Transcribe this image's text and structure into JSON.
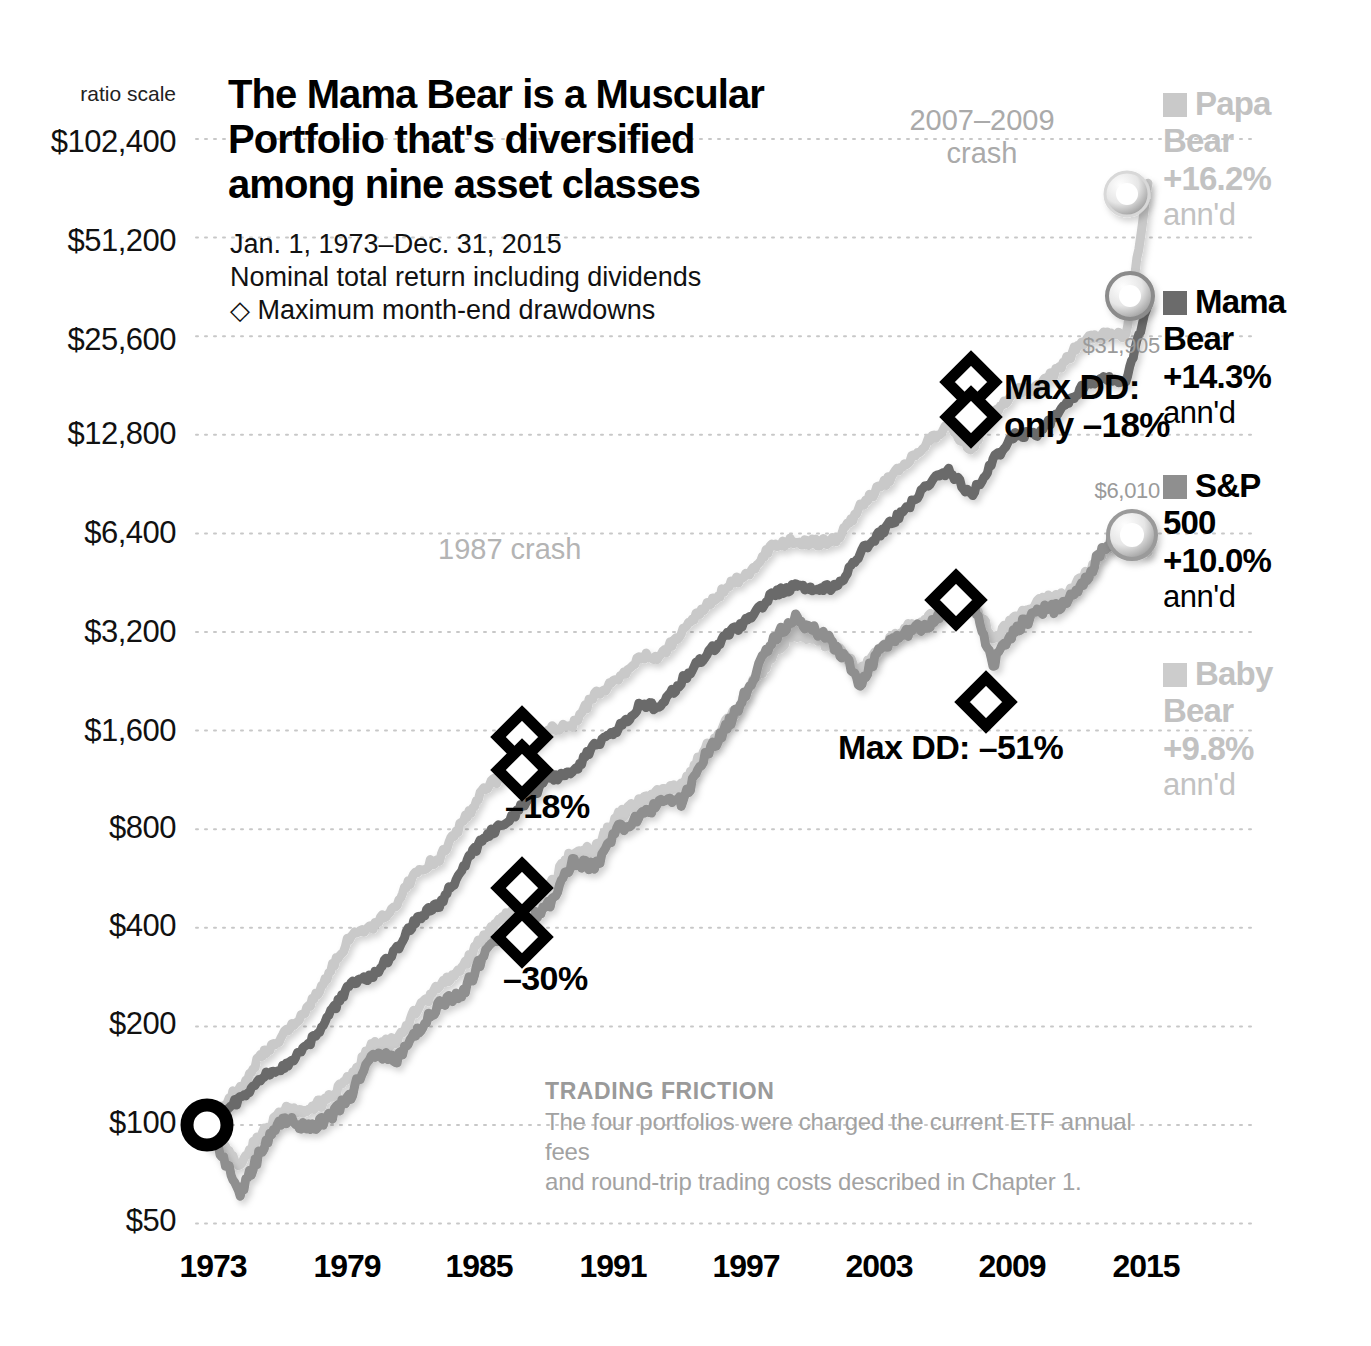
{
  "title": "The Mama Bear is a Muscular Portfolio that's diversified among nine asset classes",
  "subtitle": {
    "period": "Jan. 1, 1973–Dec. 31, 2015",
    "basis": "Nominal total return including dividends",
    "drawdown_key": "Maximum month-end drawdowns",
    "drawdown_marker": "◇"
  },
  "axis": {
    "ratio_scale_label": "ratio scale",
    "y_ticks": [
      "$102,400",
      "$51,200",
      "$25,600",
      "$12,800",
      "$6,400",
      "$3,200",
      "$1,600",
      "$800",
      "$400",
      "$200",
      "$100",
      "$50"
    ],
    "x_ticks": [
      "1973",
      "1979",
      "1985",
      "1991",
      "1997",
      "2003",
      "2009",
      "2015"
    ]
  },
  "annotations": {
    "crash_2007": "2007–2009\ncrash",
    "crash_2007_line1": "2007–2009",
    "crash_2007_line2": "crash",
    "crash_1987": "1987 crash",
    "mama_dd_line1": "Max DD:",
    "mama_dd_line2": "only –18%",
    "sp500_dd": "Max DD: –51%",
    "papa_dd": "–18%",
    "baby_dd": "–30%",
    "mama_end_value": "$31,905",
    "sp500_end_value": "$6,010"
  },
  "legend": [
    {
      "name_line1": "Papa",
      "name_line2": "Bear",
      "return": "+16.2%",
      "suffix": "ann'd",
      "color": "#c9c9c9",
      "text_color": "#c2c2c2"
    },
    {
      "name_line1": "Mama",
      "name_line2": "Bear",
      "return": "+14.3%",
      "suffix": "ann'd",
      "color": "#6b6b6b",
      "text_color": "#000000"
    },
    {
      "name_line1": "S&P",
      "name_line2": "500",
      "return": "+10.0%",
      "suffix": "ann'd",
      "color": "#8f8f8f",
      "text_color": "#000000"
    },
    {
      "name_line1": "Baby",
      "name_line2": "Bear",
      "return": "+9.8%",
      "suffix": "ann'd",
      "color": "#cccccc",
      "text_color": "#c2c2c2"
    }
  ],
  "friction": {
    "heading": "TRADING FRICTION",
    "line1": "The four portfolios were charged the current ETF annual fees",
    "line2": "and round-trip trading costs described in Chapter 1."
  },
  "chart_data": {
    "type": "line",
    "title": "The Mama Bear is a Muscular Portfolio that's diversified among nine asset classes",
    "subtitle": "Jan. 1, 1973–Dec. 31, 2015 — Nominal total return including dividends",
    "xlabel": "",
    "ylabel": "Growth of $100 (ratio scale)",
    "scale": "log",
    "ylim": [
      50,
      102400
    ],
    "xlim": [
      1973,
      2016
    ],
    "ytick_values": [
      102400,
      51200,
      25600,
      12800,
      6400,
      3200,
      1600,
      800,
      400,
      200,
      100,
      50
    ],
    "xtick_values": [
      1973,
      1979,
      1985,
      1991,
      1997,
      2003,
      2009,
      2015
    ],
    "grid": "dotted-horizontal",
    "legend_position": "right",
    "series": [
      {
        "name": "Papa Bear",
        "color": "#c9c9c9",
        "annualized_return_pct": 16.2,
        "start_value": 100,
        "end_value": 75000,
        "max_drawdown_pct": -18,
        "x": [
          1973,
          1974,
          1975,
          1976,
          1977,
          1978,
          1979,
          1980,
          1981,
          1982,
          1983,
          1984,
          1985,
          1986,
          1987,
          1988,
          1989,
          1990,
          1991,
          1992,
          1993,
          1994,
          1995,
          1996,
          1997,
          1998,
          1999,
          2000,
          2001,
          2002,
          2003,
          2004,
          2005,
          2006,
          2007,
          2008,
          2009,
          2010,
          2011,
          2012,
          2013,
          2014,
          2015,
          2016
        ],
        "values": [
          100,
          112,
          130,
          165,
          190,
          225,
          290,
          380,
          400,
          470,
          600,
          650,
          830,
          1060,
          1180,
          1400,
          1620,
          1650,
          2050,
          2250,
          2700,
          2700,
          3250,
          3800,
          4400,
          4900,
          5800,
          6100,
          6000,
          6100,
          7800,
          9000,
          10300,
          12200,
          13800,
          11500,
          14800,
          17500,
          17800,
          20500,
          24500,
          26000,
          25500,
          75000
        ]
      },
      {
        "name": "Mama Bear",
        "color": "#6b6b6b",
        "annualized_return_pct": 14.3,
        "start_value": 100,
        "end_value": 31905,
        "max_drawdown_pct": -18,
        "x": [
          1973,
          1974,
          1975,
          1976,
          1977,
          1978,
          1979,
          1980,
          1981,
          1982,
          1983,
          1984,
          1985,
          1986,
          1987,
          1988,
          1989,
          1990,
          1991,
          1992,
          1993,
          1994,
          1995,
          1996,
          1997,
          1998,
          1999,
          2000,
          2001,
          2002,
          2003,
          2004,
          2005,
          2006,
          2007,
          2008,
          2009,
          2010,
          2011,
          2012,
          2013,
          2014,
          2015,
          2016
        ],
        "values": [
          100,
          108,
          120,
          140,
          152,
          172,
          215,
          270,
          285,
          340,
          430,
          470,
          600,
          760,
          830,
          990,
          1150,
          1180,
          1450,
          1600,
          1900,
          1900,
          2300,
          2700,
          3150,
          3500,
          4150,
          4400,
          4350,
          4400,
          5600,
          6500,
          7500,
          8900,
          10000,
          8300,
          10700,
          12700,
          12900,
          14900,
          17800,
          19000,
          18600,
          31905
        ]
      },
      {
        "name": "S&P 500",
        "color": "#8f8f8f",
        "annualized_return_pct": 10.0,
        "start_value": 100,
        "end_value": 6010,
        "max_drawdown_pct": -51,
        "x": [
          1973,
          1974,
          1975,
          1976,
          1977,
          1978,
          1979,
          1980,
          1981,
          1982,
          1983,
          1984,
          1985,
          1986,
          1987,
          1988,
          1989,
          1990,
          1991,
          1992,
          1993,
          1994,
          1995,
          1996,
          1997,
          1998,
          1999,
          2000,
          2001,
          2002,
          2003,
          2004,
          2005,
          2006,
          2007,
          2008,
          2009,
          2010,
          2011,
          2012,
          2013,
          2014,
          2015,
          2016
        ],
        "values": [
          100,
          85,
          62,
          85,
          105,
          98,
          105,
          124,
          165,
          157,
          191,
          234,
          249,
          329,
          389,
          410,
          478,
          630,
          610,
          795,
          875,
          965,
          975,
          1340,
          1650,
          2200,
          2950,
          3570,
          3240,
          2855,
          2225,
          2865,
          3175,
          3330,
          3855,
          4070,
          2560,
          3235,
          3720,
          3800,
          4410,
          5840,
          6640,
          6010
        ]
      },
      {
        "name": "Baby Bear",
        "color": "#cccccc",
        "annualized_return_pct": 9.8,
        "start_value": 100,
        "end_value": 5600,
        "max_drawdown_pct": -30,
        "x": [
          1973,
          1974,
          1975,
          1976,
          1977,
          1978,
          1979,
          1980,
          1981,
          1982,
          1983,
          1984,
          1985,
          1986,
          1987,
          1988,
          1989,
          1990,
          1991,
          1992,
          1993,
          1994,
          1995,
          1996,
          1997,
          1998,
          1999,
          2000,
          2001,
          2002,
          2003,
          2004,
          2005,
          2006,
          2007,
          2008,
          2009,
          2010,
          2011,
          2012,
          2013,
          2014,
          2015,
          2016
        ],
        "values": [
          100,
          90,
          75,
          95,
          112,
          110,
          120,
          140,
          175,
          180,
          225,
          270,
          300,
          380,
          440,
          470,
          540,
          680,
          690,
          870,
          960,
          1050,
          1080,
          1400,
          1700,
          2150,
          2700,
          3200,
          3050,
          2850,
          2400,
          2950,
          3250,
          3450,
          3900,
          4100,
          3000,
          3500,
          3950,
          4050,
          4600,
          5700,
          6200,
          5600
        ]
      }
    ],
    "drawdown_markers": [
      {
        "series": "Papa Bear",
        "label": "–18%",
        "top_value": 1550,
        "bottom_value": 1150,
        "year": 1987
      },
      {
        "series": "Baby Bear",
        "label": "–30%",
        "top_value": 520,
        "bottom_value": 370,
        "year": 1987
      },
      {
        "series": "Mama Bear",
        "label": "Max DD: only –18%",
        "top_value": 19500,
        "bottom_value": 14000,
        "year": 2008
      },
      {
        "series": "S&P 500",
        "label": "Max DD: –51%",
        "top_value": 3950,
        "bottom_value": 1950,
        "year": 2008
      }
    ],
    "endpoint_markers": [
      {
        "series": "Papa Bear",
        "value": 75000
      },
      {
        "series": "Mama Bear",
        "value": 31905
      },
      {
        "series": "S&P 500",
        "value": 6010
      },
      {
        "series": "start",
        "value": 100
      }
    ]
  }
}
